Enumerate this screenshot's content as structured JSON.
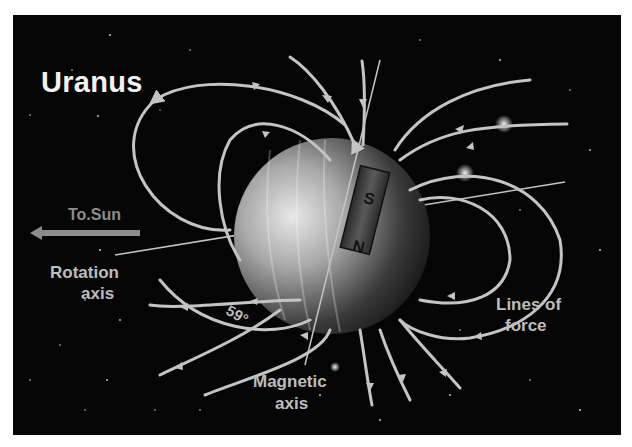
{
  "title": "Uranus",
  "labels": {
    "to_sun": "To.Sun",
    "rotation_axis_line1": "Rotation",
    "rotation_axis_line2": "axis",
    "magnetic_axis_line1": "Magnetic",
    "magnetic_axis_line2": "axis",
    "lines_of_force_line1": "Lines of",
    "lines_of_force_line2": "force",
    "angle": "59°"
  },
  "magnet": {
    "south_pole": "S",
    "north_pole": "N"
  },
  "colors": {
    "background": "#050505",
    "field_lines": "#c4c4c4",
    "text": "#bdbdbd",
    "sun_arrow": "#8c8c8c"
  }
}
